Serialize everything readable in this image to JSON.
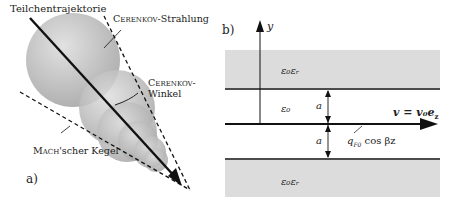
{
  "panel_a": {
    "label": "a)",
    "trajectory_label": "Teilchentrajektorie",
    "radiation_label_sc": "Cerenkov",
    "radiation_label_rest": "-Strahlung",
    "angle_label_sc": "Cerenkov-",
    "angle_label_rest": "Winkel",
    "cone_label_sc": "Mach",
    "cone_label_rest": "'scher Kegel"
  },
  "panel_b": {
    "label": "b)",
    "y_axis": "y",
    "upper_medium": "ε₀εᵣ",
    "lower_medium": "ε₀εᵣ",
    "gap_medium": "ε₀",
    "gap_upper": "a",
    "gap_lower": "a",
    "velocity": "v = v₀e",
    "velocity_sub": "z",
    "charge": "q",
    "charge_sub": "F0",
    "charge_rest": " cos βz"
  },
  "colors": {
    "slab": "#dcdcdc",
    "sphere": "#b8b8b8",
    "line": "#111111"
  }
}
